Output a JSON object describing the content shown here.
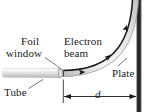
{
  "figure": {
    "background_color": "#ffffff",
    "ink_color": "#1a1a1a",
    "labels": {
      "foil_line1": "Foil",
      "foil_line2": "window",
      "electron_line1": "Electron",
      "electron_line2": "beam",
      "tube": "Tube",
      "plate": "Plate",
      "distance": "d"
    },
    "parts": {
      "tube_fill_light": "#f2f2f2",
      "tube_fill_mid": "#c9c9c9",
      "beam_fill_light": "#fafafa",
      "beam_fill_mid": "#d0d0d0",
      "beam_edge": "#1a1a1a",
      "plate_color": "#262626"
    },
    "annotations": {
      "dimension_label": "d",
      "dimension_arrow_style": "double-headed",
      "beam_arrow_count": 3
    }
  }
}
